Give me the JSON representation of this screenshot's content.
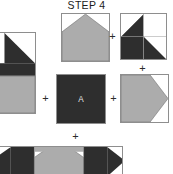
{
  "title": "STEP 4",
  "colors": {
    "dark": "#2e2e2e",
    "gray": "#acacac",
    "white": "#ffffff",
    "outline": "#8e8e8e",
    "label_text": "#e8e8e8",
    "title_text": "#1b1b1b",
    "background": "#ffffff"
  },
  "operators": {
    "plus_top": "+",
    "plus_right_vertical": "+",
    "plus_left": "+",
    "plus_right_horizontal": "+",
    "plus_bottom": "+"
  },
  "units": {
    "top_center": {
      "name": "house-peak-unit",
      "description": "gray pentagon with peaked top on white square"
    },
    "top_right": {
      "name": "four-patch-unit",
      "description": "two by two patch: dark half-square triangle, white square, solid dark square, dark half-square triangle"
    },
    "mid_left": {
      "name": "left-corner-unit",
      "description": "partially cropped unit with dark triangles and gray pentagon"
    },
    "center": {
      "name": "center-square-a",
      "label": "A",
      "description": "solid dark square labeled A"
    },
    "mid_right": {
      "name": "right-arrow-unit",
      "description": "gray pentagon pointing right on white square"
    },
    "bottom": {
      "name": "bottom-row-strip",
      "description": "wide pieced strip with dark triangles and gray center, cropped at image bottom"
    }
  }
}
